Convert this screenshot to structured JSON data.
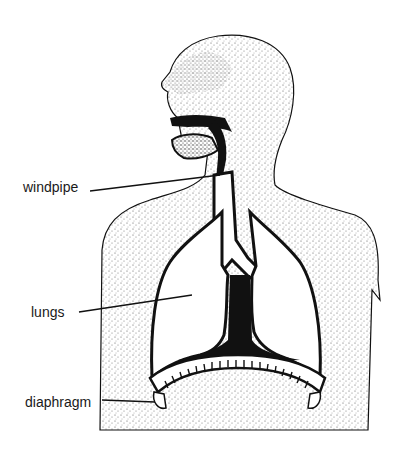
{
  "diagram": {
    "style": "black and white stippled illustration",
    "labels": [
      {
        "text": "windpipe",
        "target": "trachea"
      },
      {
        "text": "lungs",
        "target": "left lung"
      },
      {
        "text": "diaphragm",
        "target": "diaphragm muscle"
      }
    ]
  },
  "colors": {
    "ink": "#111111",
    "background": "#ffffff",
    "stipple": "#555555"
  }
}
